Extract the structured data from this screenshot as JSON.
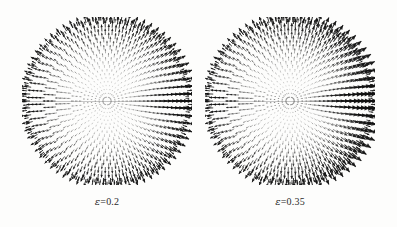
{
  "figure": {
    "background_color": "#fdfdfc",
    "ink_color": "#111111",
    "width": 397,
    "height": 227
  },
  "panels": [
    {
      "name": "panel-left",
      "label_symbol": "ε",
      "label_equals": "=",
      "label_value": "0.2",
      "label_full": "ε=0.2",
      "center_x": 107,
      "center_y": 101,
      "radius_x": 85,
      "radius_y": 84,
      "label_y": 196
    },
    {
      "name": "panel-right",
      "label_symbol": "ε",
      "label_equals": "=",
      "label_value": "0.35",
      "label_full": "ε=0.35",
      "center_x": 290,
      "center_y": 101,
      "radius_x": 85,
      "radius_y": 84,
      "label_y": 196
    }
  ],
  "chart_data": {
    "type": "scatter",
    "title": "",
    "subtitle": "",
    "xlabel": "",
    "ylabel": "",
    "grid": false,
    "legend": "none",
    "series": [
      {
        "name": "ε=0.2",
        "eccentricity": 0.2,
        "n_radial_rings": 22,
        "n_angular_spokes": 72,
        "arrow_direction": "radially outward",
        "max_arrow_length_px": 9,
        "rim_density": "high",
        "axis_band_strength": 0.55,
        "right_side_bias": 0.35
      },
      {
        "name": "ε=0.35",
        "eccentricity": 0.35,
        "n_radial_rings": 22,
        "n_angular_spokes": 72,
        "arrow_direction": "radially outward",
        "max_arrow_length_px": 11,
        "rim_density": "high",
        "axis_band_strength": 0.8,
        "right_side_bias": 0.6
      }
    ],
    "xlim": [
      -1,
      1
    ],
    "ylim": [
      -1,
      1
    ],
    "tick_labels_x": [],
    "tick_labels_y": [],
    "annotations": [
      "ε=0.2",
      "ε=0.35"
    ]
  }
}
